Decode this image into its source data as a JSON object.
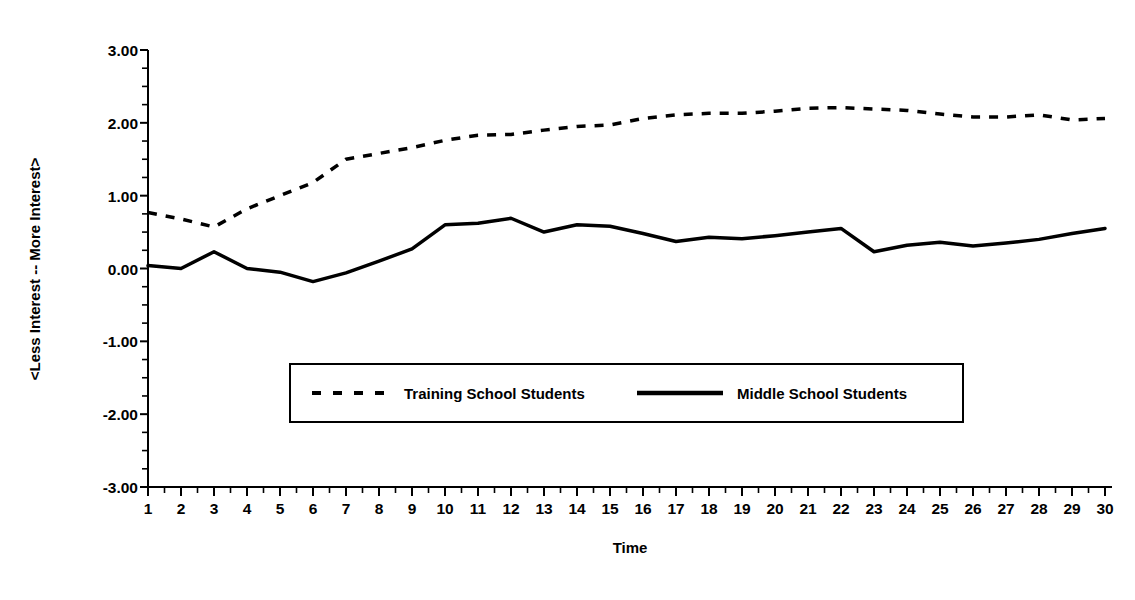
{
  "chart": {
    "title": "",
    "xlabel": "Time",
    "ylabel": "<Less Interest -- More Interest>"
  },
  "legend": {
    "series1_label": "Training School Students",
    "series2_label": "Middle School Students"
  },
  "colors": {
    "ink": "#000000",
    "background": "#ffffff"
  },
  "chart_data": {
    "type": "line",
    "title": "",
    "xlabel": "Time",
    "ylabel": "<Less Interest -- More Interest>",
    "xlim": [
      1,
      30
    ],
    "ylim": [
      -3.0,
      3.0
    ],
    "grid": false,
    "legend_position": "center",
    "xticks": [
      1,
      2,
      3,
      4,
      5,
      6,
      7,
      8,
      9,
      10,
      11,
      12,
      13,
      14,
      15,
      16,
      17,
      18,
      19,
      20,
      21,
      22,
      23,
      24,
      25,
      26,
      27,
      28,
      29,
      30
    ],
    "xtick_labels": [
      "1",
      "2",
      "3",
      "4",
      "5",
      "6",
      "7",
      "8",
      "9",
      "10",
      "11",
      "12",
      "13",
      "14",
      "15",
      "16",
      "17",
      "18",
      "19",
      "20",
      "21",
      "22",
      "23",
      "24",
      "25",
      "26",
      "27",
      "28",
      "29",
      "30"
    ],
    "yticks": [
      3.0,
      2.0,
      1.0,
      0.0,
      -1.0,
      -2.0,
      -3.0
    ],
    "ytick_labels": [
      "3.00",
      "2.00",
      "1.00",
      "0.00",
      "-1.00",
      "-2.00",
      "-3.00"
    ],
    "yminor_step": 0.25,
    "x": [
      1,
      2,
      3,
      4,
      5,
      6,
      7,
      8,
      9,
      10,
      11,
      12,
      13,
      14,
      15,
      16,
      17,
      18,
      19,
      20,
      21,
      22,
      23,
      24,
      25,
      26,
      27,
      28,
      29,
      30
    ],
    "series": [
      {
        "name": "Training School Students",
        "style": "dashed",
        "color": "#000000",
        "values": [
          0.77,
          0.68,
          0.57,
          0.82,
          1.0,
          1.18,
          1.5,
          1.58,
          1.66,
          1.76,
          1.83,
          1.84,
          1.9,
          1.95,
          1.97,
          2.06,
          2.11,
          2.13,
          2.13,
          2.16,
          2.2,
          2.21,
          2.19,
          2.17,
          2.12,
          2.08,
          2.08,
          2.11,
          2.04,
          2.06
        ]
      },
      {
        "name": "Middle School Students",
        "style": "solid",
        "color": "#000000",
        "values": [
          0.04,
          0.0,
          0.23,
          0.0,
          -0.05,
          -0.18,
          -0.06,
          0.1,
          0.27,
          0.6,
          0.62,
          0.69,
          0.5,
          0.6,
          0.58,
          0.48,
          0.37,
          0.43,
          0.41,
          0.45,
          0.5,
          0.55,
          0.23,
          0.32,
          0.36,
          0.31,
          0.35,
          0.4,
          0.48,
          0.55
        ]
      }
    ]
  }
}
